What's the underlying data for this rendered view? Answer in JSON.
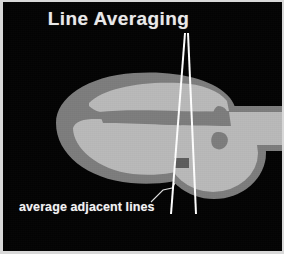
{
  "figure": {
    "title": "Line Averaging",
    "caption": "average adjacent lines",
    "background_color": "#030303",
    "frame_color": "#d8d8d8",
    "title_color": "#e9e9e9",
    "caption_color": "#f2f2f2",
    "beam_line_color": "#ffffff",
    "leader_line_color": "#e0e0e0",
    "tissue_outer_color": "#7d7d7d",
    "tissue_inner_color": "#b9b9b9",
    "septum_color": "#7d7d7d",
    "marker_color": "#5c5c5c",
    "width_px": 284,
    "height_px": 254
  },
  "diagram": {
    "beam_apex": {
      "x": 185,
      "y": 31
    },
    "beam_left_end": {
      "x": 171,
      "y": 212
    },
    "beam_right_end": {
      "x": 196,
      "y": 212
    },
    "marker_box": {
      "x": 171,
      "y": 156,
      "w": 15,
      "h": 10
    },
    "leader_start": {
      "x": 150,
      "y": 199
    },
    "leader_end": {
      "x": 173,
      "y": 181
    }
  }
}
